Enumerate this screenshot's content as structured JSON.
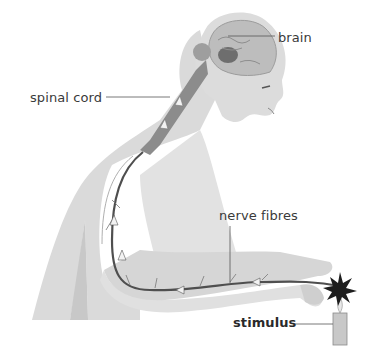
{
  "diagram": {
    "labels": {
      "brain": "brain",
      "spinal_cord": "spinal cord",
      "nerve_fibres": "nerve fibres",
      "stimulus": "stimulus"
    },
    "colors": {
      "skin": "#d9d9d9",
      "skin_shadow": "#c4c4c4",
      "spinal_cord": "#8c8c8c",
      "nerve": "#555555",
      "brain": "#b8b8b8",
      "leader_line": "#555555",
      "text": "#3a3a3a"
    }
  }
}
